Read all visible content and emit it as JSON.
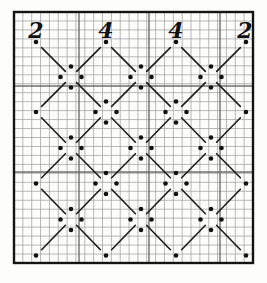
{
  "chart_data": {
    "type": "diagram",
    "canvas": {
      "width": 267,
      "height": 283,
      "background": "#fdfdfc"
    },
    "frame": {
      "x": 14,
      "y": 12,
      "width": 239,
      "height": 251,
      "stroke": "#141414",
      "stroke_width": 2.4
    },
    "graph_paper": {
      "columns": 27,
      "rows": 28,
      "minor_color": "#a6a6a6",
      "minor_width": 0.8,
      "heavy_color": "#6e6e6e",
      "heavy_width": 1.4,
      "heavy_vertical_x": [
        79,
        149,
        220
      ],
      "heavy_horizontal_y": [
        86,
        172
      ]
    },
    "top_labels": {
      "labels": [
        "2",
        "4",
        "4",
        "2"
      ],
      "x": [
        36,
        106,
        176,
        245
      ],
      "baseline_y": 38,
      "font_size": 22,
      "color": "#111111"
    },
    "lattice": {
      "apex_columns": [
        36,
        106,
        176,
        246
      ],
      "mid_columns": [
        71,
        141,
        211
      ],
      "rows": [
        42,
        77,
        112,
        148,
        183.5,
        219.5,
        255.5
      ],
      "diagonal_half_span": 35,
      "cluster_offset": 10.5,
      "dot_radius": 2.3,
      "dot_color": "#111111",
      "line_color": "#1c1c1c",
      "line_width": 1.6,
      "line_end_gap": 8
    }
  }
}
